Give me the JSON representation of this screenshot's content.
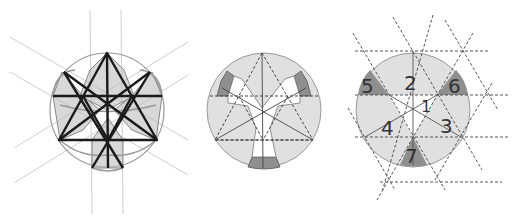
{
  "figure": {
    "panels": [
      {
        "id": "left",
        "description": "Hexagram construction with overlapping shaded petal shapes and guide lines"
      },
      {
        "id": "middle",
        "description": "Circle with white Y-shaped cutout, dashed triangles and dark corner segments"
      },
      {
        "id": "right",
        "description": "Circle divided into numbered regions by dashed triangular grid"
      }
    ],
    "labels": {
      "n1": "1",
      "n2": "2",
      "n3": "3",
      "n4": "4",
      "n5": "5",
      "n6": "6",
      "n7": "7"
    },
    "colors": {
      "light_fill": "#e0e0e0",
      "dark_fill": "#8c8c8c",
      "stroke_dark": "#1a1a1a",
      "guide": "#c8c8c8"
    }
  }
}
